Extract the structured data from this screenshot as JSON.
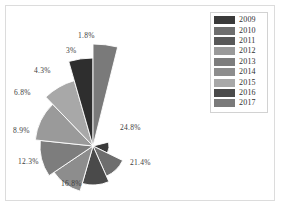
{
  "figure": {
    "background_color": "#ffffff",
    "frame_color": "#dcdcdc"
  },
  "legend": {
    "name": "legend",
    "border_color": "#d2d2d2",
    "position": "top-right",
    "entries": [
      {
        "label": "2009",
        "color": "#3a3a3a"
      },
      {
        "label": "2010",
        "color": "#6e6e6e"
      },
      {
        "label": "2011",
        "color": "#585858"
      },
      {
        "label": "2012",
        "color": "#9a9a9a"
      },
      {
        "label": "2013",
        "color": "#7d7d7d"
      },
      {
        "label": "2014",
        "color": "#8d8d8d"
      },
      {
        "label": "2015",
        "color": "#a8a8a8"
      },
      {
        "label": "2016",
        "color": "#4a4a4a"
      },
      {
        "label": "2017",
        "color": "#7a7a7a"
      }
    ]
  },
  "chart_data": {
    "type": "pie",
    "variant": "nightingale-rose-polar-area",
    "title": "",
    "subtitle": "",
    "xlabel": "",
    "ylabel": "",
    "grid": false,
    "legend_position": "top-right",
    "center": {
      "x": 93,
      "y": 146
    },
    "max_radius": 108,
    "categories": [
      "2009",
      "2010",
      "2011",
      "2012",
      "2013",
      "2014",
      "2015",
      "2016",
      "2017"
    ],
    "values": [
      24.8,
      21.4,
      16.8,
      12.3,
      8.9,
      6.8,
      4.3,
      3.0,
      1.8
    ],
    "labels": [
      "24.8%",
      "21.4%",
      "16.8%",
      "12.3%",
      "8.9%",
      "6.8%",
      "4.3%",
      "3%",
      "1.8%"
    ],
    "colors": [
      "#3a3a3a",
      "#6e6e6e",
      "#4a4a4a",
      "#8d8d8d",
      "#7d7d7d",
      "#9a9a9a",
      "#a8a8a8",
      "#2e2e2e",
      "#7a7a7a"
    ],
    "slices": [
      {
        "category": "2009",
        "value": 24.8,
        "label": "24.8%",
        "color": "#3a3a3a",
        "start_angle": -14,
        "end_angle": 26,
        "radius": 16,
        "label_x": 120,
        "label_y": 124
      },
      {
        "category": "2010",
        "value": 21.4,
        "label": "21.4%",
        "color": "#6e6e6e",
        "start_angle": 26,
        "end_angle": 66,
        "radius": 33,
        "label_x": 130,
        "label_y": 159
      },
      {
        "category": "2011",
        "value": 16.8,
        "label": "16.8%",
        "color": "#4a4a4a",
        "start_angle": 66,
        "end_angle": 106,
        "radius": 39,
        "label_x": 61,
        "label_y": 180
      },
      {
        "category": "2012",
        "value": 12.3,
        "label": "12.3%",
        "color": "#8d8d8d",
        "start_angle": 106,
        "end_angle": 146,
        "radius": 47,
        "label_x": 18,
        "label_y": 158
      },
      {
        "category": "2013",
        "value": 8.9,
        "label": "8.9%",
        "color": "#7d7d7d",
        "start_angle": 146,
        "end_angle": 186,
        "radius": 53,
        "label_x": 13,
        "label_y": 127
      },
      {
        "category": "2014",
        "value": 6.8,
        "label": "6.8%",
        "color": "#9a9a9a",
        "start_angle": 186,
        "end_angle": 226,
        "radius": 58,
        "label_x": 14,
        "label_y": 89
      },
      {
        "category": "2015",
        "value": 4.3,
        "label": "4.3%",
        "color": "#a8a8a8",
        "start_angle": 226,
        "end_angle": 254,
        "radius": 68,
        "label_x": 34,
        "label_y": 67
      },
      {
        "category": "2016",
        "value": 3.0,
        "label": "3%",
        "color": "#2e2e2e",
        "start_angle": 254,
        "end_angle": 270,
        "radius": 88,
        "label_x": 66,
        "label_y": 47
      },
      {
        "category": "2017",
        "value": 1.8,
        "label": "1.8%",
        "color": "#7a7a7a",
        "start_angle": 270,
        "end_angle": 284,
        "radius": 102,
        "label_x": 78,
        "label_y": 32
      }
    ]
  }
}
